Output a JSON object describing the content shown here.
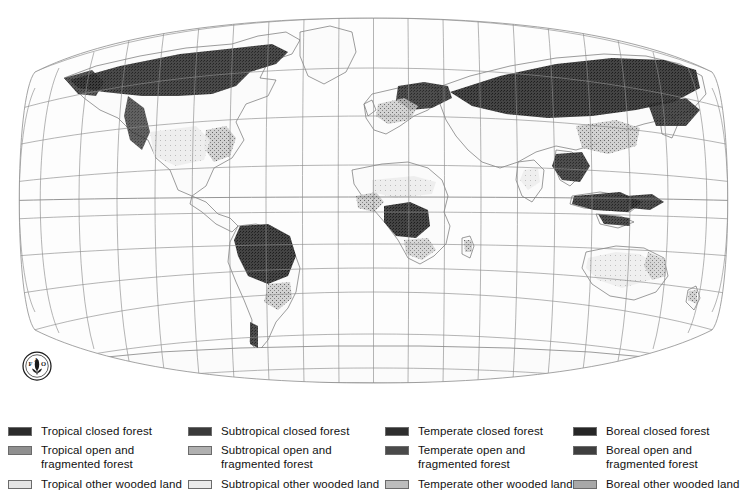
{
  "figure": {
    "type": "thematic-world-map",
    "projection": "Robinson",
    "background_color": "#ffffff",
    "graticule": {
      "visible": true,
      "color": "#8a8a8a",
      "meridian_interval_degrees": 20,
      "parallel_interval_degrees": 20,
      "central_meridian_degrees": 0
    },
    "coastline_color": "#5a5a5a",
    "land_fill_color": "#fbfbfb",
    "emblem": {
      "name": "fao-logo",
      "letters": "FAO",
      "motto": "FIAT PANIS",
      "color": "#1a1a1a"
    }
  },
  "legend": {
    "swatch_border_color": "#6b6b6b",
    "columns": [
      {
        "name": "tropical",
        "entries": [
          {
            "label": "Tropical closed forest",
            "color": "#2b2b2b"
          },
          {
            "label": "Tropical open and\nfragmented forest",
            "color": "#8f8f8f"
          },
          {
            "label": "Tropical other wooded land",
            "color": "#e4e4e4"
          }
        ]
      },
      {
        "name": "subtropical",
        "entries": [
          {
            "label": "Subtropical closed forest",
            "color": "#3a3a3a"
          },
          {
            "label": "Subtropical open and\nfragmented forest",
            "color": "#b0b0b0"
          },
          {
            "label": "Subtropical other wooded land",
            "color": "#eaeaea"
          }
        ]
      },
      {
        "name": "temperate",
        "entries": [
          {
            "label": "Temperate closed forest",
            "color": "#2f2f2f"
          },
          {
            "label": "Temperate open and\nfragmented forest",
            "color": "#4a4a4a"
          },
          {
            "label": "Temperate other wooded land",
            "color": "#bdbdbd"
          }
        ]
      },
      {
        "name": "boreal",
        "entries": [
          {
            "label": "Boreal closed forest",
            "color": "#262626"
          },
          {
            "label": "Boreal open and\nfragmented forest",
            "color": "#3f3f3f"
          },
          {
            "label": "Boreal other wooded land",
            "color": "#a8a8a8"
          }
        ]
      }
    ]
  }
}
